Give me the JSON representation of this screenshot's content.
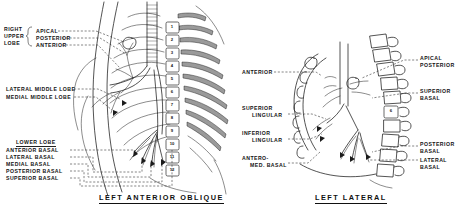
{
  "figure": {
    "type": "medical-anatomy-illustration",
    "background_color": "#ffffff",
    "ink_color": "#1b1b1b",
    "panels": [
      {
        "id": "left-anterior-oblique",
        "caption": "LEFT ANTERIOR OBLIQUE",
        "vertebrae_numbers": [
          "1",
          "2",
          "3",
          "4",
          "5",
          "6",
          "7",
          "8",
          "9",
          "10",
          "11",
          "12"
        ],
        "label_groups": [
          {
            "id": "right-upper-lobe",
            "group_label_lines": [
              "RIGHT",
              "UPPER",
              "LOBE"
            ],
            "has_brace": true,
            "items": [
              "APICAL",
              "POSTERIOR",
              "ANTERIOR"
            ]
          },
          {
            "id": "middle-lobe",
            "group_label_lines": [],
            "has_brace": false,
            "items": [
              "LATERAL MIDDLE LOBE",
              "MEDIAL MIDDLE LOBE"
            ]
          },
          {
            "id": "lower-lobe",
            "heading": "LOWER LOBE",
            "heading_underlined": true,
            "has_brace": false,
            "items": [
              "ANTERIOR BASAL",
              "LATERAL BASAL",
              "MEDIAL BASAL",
              "POSTERIOR BASAL",
              "SUPERIOR BASAL"
            ]
          }
        ]
      },
      {
        "id": "left-lateral",
        "caption": "LEFT LATERAL",
        "vertebrae_numbers": [
          "6"
        ],
        "labels_left": [
          {
            "lines": [
              "ANTERIOR"
            ]
          },
          {
            "lines": [
              "SUPERIOR",
              "LINGULAR"
            ]
          },
          {
            "lines": [
              "INFERIOR",
              "LINGULAR"
            ]
          },
          {
            "lines": [
              "ANTERO-",
              "MED. BASAL"
            ]
          }
        ],
        "labels_right": [
          {
            "lines": [
              "APICAL",
              "POSTERIOR"
            ]
          },
          {
            "lines": [
              "SUPERIOR",
              "BASAL"
            ]
          },
          {
            "lines": [
              "POSTERIOR",
              "BASAL"
            ]
          },
          {
            "lines": [
              "LATERAL",
              "BASAL"
            ]
          }
        ]
      }
    ]
  }
}
